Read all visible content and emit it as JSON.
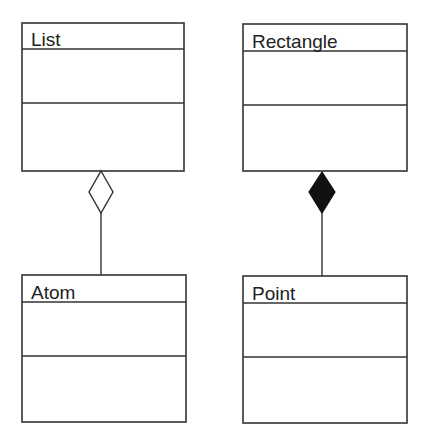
{
  "diagram": {
    "type": "UML class diagram",
    "classes": [
      {
        "id": "list",
        "name": "List",
        "attributes": [],
        "operations": []
      },
      {
        "id": "rectangle",
        "name": "Rectangle",
        "attributes": [],
        "operations": []
      },
      {
        "id": "atom",
        "name": "Atom",
        "attributes": [],
        "operations": []
      },
      {
        "id": "point",
        "name": "Point",
        "attributes": [],
        "operations": []
      }
    ],
    "relationships": [
      {
        "type": "aggregation",
        "whole": "List",
        "part": "Atom",
        "diamond": "hollow"
      },
      {
        "type": "composition",
        "whole": "Rectangle",
        "part": "Point",
        "diamond": "filled"
      }
    ],
    "colors": {
      "line": "#333333",
      "filled_diamond": "#111111",
      "background": "#ffffff"
    }
  }
}
